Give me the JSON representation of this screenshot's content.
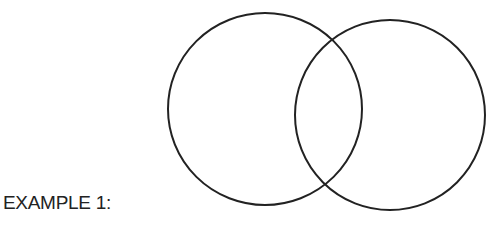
{
  "label": "EXAMPLE 1:",
  "diagram": {
    "type": "venn",
    "stroke_color": "#222222",
    "circles": [
      {
        "name": "left-circle",
        "cx": 265,
        "cy": 109,
        "rx": 97,
        "ry": 96
      },
      {
        "name": "right-circle",
        "cx": 390,
        "cy": 115,
        "rx": 95,
        "ry": 95
      }
    ]
  }
}
